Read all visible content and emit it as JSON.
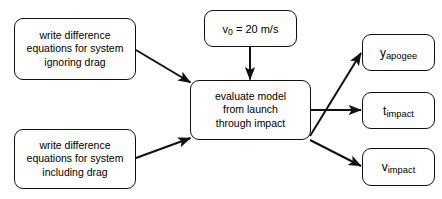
{
  "diagram": {
    "stroke_color": "#111111",
    "background_color": "#ffffff",
    "inputs": [
      {
        "id": "no-drag",
        "lines": [
          "write difference",
          "equations for system",
          "ignoring drag"
        ]
      },
      {
        "id": "with-drag",
        "lines": [
          "write difference",
          "equations for system",
          "including drag"
        ]
      }
    ],
    "parameter": {
      "id": "initial-velocity",
      "symbol": "v",
      "subscript": "0",
      "equals": " = ",
      "value": "20 m/s",
      "full_text": "v0 = 20 m/s"
    },
    "process": {
      "id": "evaluate-model",
      "lines": [
        "evaluate model",
        "from launch",
        "through impact"
      ]
    },
    "outputs": [
      {
        "id": "y-apogee",
        "symbol": "y",
        "subscript": "apogee",
        "full_text": "yapogee"
      },
      {
        "id": "t-impact",
        "symbol": "t",
        "subscript": "impact",
        "full_text": "timpact"
      },
      {
        "id": "v-impact",
        "symbol": "v",
        "subscript": "impact",
        "full_text": "vimpact"
      }
    ],
    "edges": [
      {
        "id": "edge-no-drag-to-model",
        "from": "no-drag",
        "to": "evaluate-model"
      },
      {
        "id": "edge-with-drag-to-model",
        "from": "with-drag",
        "to": "evaluate-model"
      },
      {
        "id": "edge-velocity-to-model",
        "from": "initial-velocity",
        "to": "evaluate-model"
      },
      {
        "id": "edge-model-to-y-apogee",
        "from": "evaluate-model",
        "to": "y-apogee"
      },
      {
        "id": "edge-model-to-t-impact",
        "from": "evaluate-model",
        "to": "t-impact"
      },
      {
        "id": "edge-model-to-v-impact",
        "from": "evaluate-model",
        "to": "v-impact"
      }
    ]
  }
}
